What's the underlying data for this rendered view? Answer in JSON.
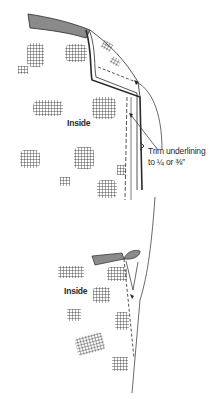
{
  "figure": {
    "colors": {
      "ink": "#2a2a2a",
      "fabric_shade": "#8a8a8a",
      "background": "#ffffff"
    },
    "upper_view": {
      "label": "Inside"
    },
    "lower_view": {
      "label": "Inside"
    },
    "callout": {
      "line1": "Trim underlining",
      "line2": "to ¼ or ⅜″"
    }
  }
}
